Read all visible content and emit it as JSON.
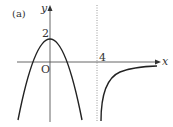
{
  "figure": {
    "panel_label": "(a)",
    "x_axis_label": "x",
    "y_axis_label": "y",
    "origin_label": "O",
    "y_intercept_label": "2",
    "asymptote_label": "4",
    "colors": {
      "curve": "#222222",
      "axis": "#555555",
      "asymptote": "#999999",
      "background": "#ffffff"
    }
  }
}
